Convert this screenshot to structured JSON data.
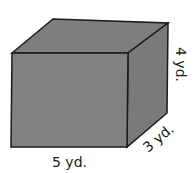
{
  "figure": {
    "shape": "rectangular prism",
    "colors": {
      "fill": "#808080",
      "edge": "#1a1a1a",
      "background": "#ffffff"
    },
    "labels": {
      "length": "5 yd.",
      "width": "3 yd.",
      "height": "4 yd."
    }
  }
}
